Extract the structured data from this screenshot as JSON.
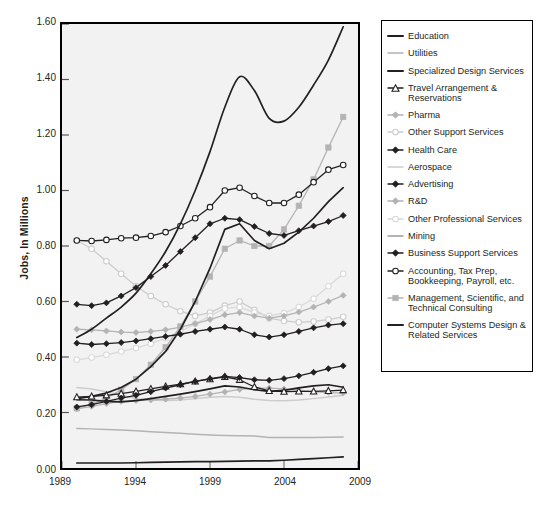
{
  "chart": {
    "type": "line",
    "title": "",
    "ylabel": "Jobs, In Millions",
    "xlabel": "",
    "ylim": [
      0.0,
      1.6
    ],
    "xlim": [
      1989,
      2009
    ],
    "yticks": [
      "0.00",
      "0.20",
      "0.40",
      "0.60",
      "0.80",
      "1.00",
      "1.20",
      "1.40",
      "1.60"
    ],
    "xticks": [
      "1989",
      "1994",
      "1999",
      "2004",
      "2009"
    ],
    "grid": false,
    "legend_position": "right",
    "plot_background": "#f2f2f2",
    "frame_color": "#000000"
  },
  "chart_data": {
    "type": "line",
    "title": "",
    "xlabel": "",
    "ylabel": "Jobs, In Millions",
    "ylim": [
      0.0,
      1.6
    ],
    "xlim": [
      1989,
      2009
    ],
    "grid": false,
    "legend_position": "right",
    "x": [
      1990,
      1991,
      1992,
      1993,
      1994,
      1995,
      1996,
      1997,
      1998,
      1999,
      2000,
      2001,
      2002,
      2003,
      2004,
      2005,
      2006,
      2007,
      2008
    ],
    "series": [
      {
        "name": "Education",
        "color": "#231f20",
        "marker": "none",
        "smooth": true,
        "values": [
          0.47,
          0.5,
          0.54,
          0.58,
          0.63,
          0.7,
          0.78,
          0.88,
          1.0,
          1.14,
          1.3,
          1.41,
          1.36,
          1.26,
          1.25,
          1.3,
          1.38,
          1.47,
          1.59
        ]
      },
      {
        "name": "Utilities",
        "color": "#b3b3b3",
        "marker": "none",
        "smooth": false,
        "values": [
          0.142,
          0.141,
          0.139,
          0.137,
          0.134,
          0.131,
          0.128,
          0.125,
          0.122,
          0.119,
          0.117,
          0.116,
          0.115,
          0.11,
          0.11,
          0.11,
          0.11,
          0.111,
          0.112
        ]
      },
      {
        "name": "Specialized Design Services",
        "color": "#231f20",
        "marker": "none",
        "smooth": false,
        "values": [
          0.246,
          0.245,
          0.24,
          0.238,
          0.243,
          0.25,
          0.258,
          0.266,
          0.275,
          0.285,
          0.296,
          0.292,
          0.282,
          0.276,
          0.28,
          0.289,
          0.296,
          0.3,
          0.291
        ]
      },
      {
        "name": "Travel Arrangement & Reservations",
        "color": "#231f20",
        "marker": "triangle-open",
        "smooth": false,
        "values": [
          0.255,
          0.258,
          0.262,
          0.268,
          0.276,
          0.285,
          0.294,
          0.302,
          0.312,
          0.32,
          0.328,
          0.318,
          0.292,
          0.278,
          0.275,
          0.276,
          0.276,
          0.278,
          0.281
        ]
      },
      {
        "name": "Pharma",
        "color": "#b3b3b3",
        "marker": "diamond-fill",
        "smooth": false,
        "values": [
          0.213,
          0.222,
          0.232,
          0.24,
          0.243,
          0.245,
          0.248,
          0.252,
          0.258,
          0.266,
          0.274,
          0.283,
          0.288,
          0.288,
          0.285,
          0.28,
          0.275,
          0.272,
          0.27
        ]
      },
      {
        "name": "Other Support Services",
        "color": "#cccccc",
        "marker": "circle-open",
        "smooth": false,
        "values": [
          0.82,
          0.79,
          0.745,
          0.7,
          0.655,
          0.62,
          0.59,
          0.565,
          0.548,
          0.56,
          0.585,
          0.6,
          0.57,
          0.54,
          0.53,
          0.525,
          0.528,
          0.535,
          0.545
        ]
      },
      {
        "name": "Health Care",
        "color": "#231f20",
        "marker": "diamond-fill",
        "smooth": false,
        "values": [
          0.59,
          0.585,
          0.595,
          0.62,
          0.65,
          0.69,
          0.73,
          0.78,
          0.83,
          0.88,
          0.9,
          0.895,
          0.87,
          0.845,
          0.838,
          0.855,
          0.872,
          0.888,
          0.91
        ]
      },
      {
        "name": "Aerospace",
        "color": "#cccccc",
        "marker": "none",
        "smooth": false,
        "values": [
          0.29,
          0.285,
          0.275,
          0.262,
          0.25,
          0.245,
          0.243,
          0.245,
          0.25,
          0.255,
          0.258,
          0.255,
          0.248,
          0.243,
          0.242,
          0.245,
          0.25,
          0.256,
          0.262
        ]
      },
      {
        "name": "Advertising",
        "color": "#231f20",
        "marker": "diamond-fill",
        "smooth": false,
        "values": [
          0.45,
          0.445,
          0.448,
          0.452,
          0.458,
          0.466,
          0.474,
          0.482,
          0.492,
          0.5,
          0.508,
          0.5,
          0.48,
          0.472,
          0.48,
          0.492,
          0.505,
          0.515,
          0.52
        ]
      },
      {
        "name": "R&D",
        "color": "#b3b3b3",
        "marker": "diamond-fill",
        "smooth": false,
        "values": [
          0.5,
          0.498,
          0.494,
          0.49,
          0.488,
          0.492,
          0.498,
          0.508,
          0.52,
          0.535,
          0.552,
          0.56,
          0.548,
          0.54,
          0.548,
          0.562,
          0.58,
          0.6,
          0.622
        ]
      },
      {
        "name": "Other Professional Services",
        "color": "#d9d9d9",
        "marker": "circle-open",
        "smooth": false,
        "values": [
          0.39,
          0.398,
          0.408,
          0.42,
          0.432,
          0.448,
          0.468,
          0.492,
          0.52,
          0.548,
          0.575,
          0.58,
          0.56,
          0.548,
          0.558,
          0.58,
          0.61,
          0.655,
          0.7
        ]
      },
      {
        "name": "Mining",
        "color": "#231f20",
        "marker": "none",
        "smooth": false,
        "values": [
          0.018,
          0.018,
          0.018,
          0.018,
          0.019,
          0.02,
          0.021,
          0.022,
          0.023,
          0.023,
          0.024,
          0.025,
          0.026,
          0.026,
          0.028,
          0.031,
          0.034,
          0.037,
          0.04
        ]
      },
      {
        "name": "Business Support Services",
        "color": "#231f20",
        "marker": "diamond-fill",
        "smooth": false,
        "values": [
          0.22,
          0.228,
          0.24,
          0.252,
          0.262,
          0.275,
          0.288,
          0.3,
          0.312,
          0.322,
          0.33,
          0.326,
          0.318,
          0.316,
          0.322,
          0.332,
          0.345,
          0.358,
          0.368
        ]
      },
      {
        "name": "Accounting, Tax Prep, Bookkeeping, Payroll, etc.",
        "color": "#231f20",
        "marker": "circle-open",
        "smooth": false,
        "values": [
          0.82,
          0.818,
          0.822,
          0.828,
          0.83,
          0.836,
          0.85,
          0.872,
          0.9,
          0.94,
          1.0,
          1.01,
          0.98,
          0.955,
          0.955,
          0.985,
          1.03,
          1.075,
          1.092
        ]
      },
      {
        "name": "Management, Scientific, and Technical Consulting",
        "color": "#b3b3b3",
        "marker": "square-fill",
        "smooth": false,
        "values": [
          0.215,
          0.23,
          0.252,
          0.282,
          0.32,
          0.372,
          0.435,
          0.51,
          0.6,
          0.69,
          0.79,
          0.82,
          0.8,
          0.8,
          0.86,
          0.945,
          1.04,
          1.155,
          1.265
        ]
      },
      {
        "name": "Computer Systems Design & Related Services",
        "color": "#231f20",
        "marker": "none",
        "smooth": false,
        "values": [
          0.25,
          0.258,
          0.27,
          0.29,
          0.32,
          0.365,
          0.42,
          0.5,
          0.6,
          0.72,
          0.86,
          0.88,
          0.82,
          0.79,
          0.81,
          0.85,
          0.9,
          0.96,
          1.01
        ]
      }
    ]
  },
  "legend": {
    "entries": [
      {
        "label": "Education",
        "marker": "line-thick-dark",
        "color": "#231f20"
      },
      {
        "label": "Utilities",
        "marker": "line-thin-gray",
        "color": "#b3b3b3"
      },
      {
        "label": "Specialized Design Services",
        "marker": "line-thick-dark",
        "color": "#231f20"
      },
      {
        "label": "Travel Arrangement & Reservations",
        "marker": "line-triangle-open",
        "color": "#231f20"
      },
      {
        "label": "Pharma",
        "marker": "line-diamond-gray",
        "color": "#b3b3b3"
      },
      {
        "label": "Other Support Services",
        "marker": "line-circle-open-gray",
        "color": "#cccccc"
      },
      {
        "label": "Health Care",
        "marker": "line-diamond-dark",
        "color": "#231f20"
      },
      {
        "label": "Aerospace",
        "marker": "line-thin-gray",
        "color": "#cccccc"
      },
      {
        "label": "Advertising",
        "marker": "line-diamond-dark",
        "color": "#231f20"
      },
      {
        "label": "R&D",
        "marker": "line-diamond-gray",
        "color": "#b3b3b3"
      },
      {
        "label": "Other Professional Services",
        "marker": "line-circle-open-gray",
        "color": "#d9d9d9"
      },
      {
        "label": "Mining",
        "marker": "line-thin-gray",
        "color": "#999999"
      },
      {
        "label": "Business Support Services",
        "marker": "line-diamond-dark",
        "color": "#231f20"
      },
      {
        "label": "Accounting, Tax Prep, Bookkeeping, Payroll, etc.",
        "marker": "line-circle-open-dark",
        "color": "#231f20"
      },
      {
        "label": "Management, Scientific, and Technical Consulting",
        "marker": "line-square-gray",
        "color": "#b3b3b3"
      },
      {
        "label": "Computer Systems Design & Related Services",
        "marker": "line-thick-dark",
        "color": "#231f20"
      }
    ]
  }
}
